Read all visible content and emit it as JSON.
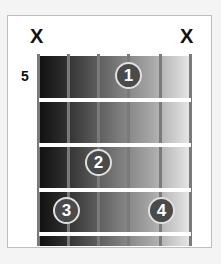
{
  "chord_diagram": {
    "start_fret_label": "5",
    "strings": 6,
    "muted_strings": [
      {
        "string": 6,
        "symbol": "X"
      },
      {
        "string": 1,
        "symbol": "X"
      }
    ],
    "fingers": [
      {
        "finger": "1",
        "string": 3,
        "fret_row": 1
      },
      {
        "finger": "2",
        "string": 4,
        "fret_row": 3
      },
      {
        "finger": "3",
        "string": 5,
        "fret_row": 4
      },
      {
        "finger": "4",
        "string": 2,
        "fret_row": 4
      }
    ],
    "colors": {
      "board_dark": "#111111",
      "board_light": "#e8e8e8",
      "dot": "#4a4a4a",
      "fret": "#ffffff",
      "string": "#7a7a7a"
    }
  }
}
